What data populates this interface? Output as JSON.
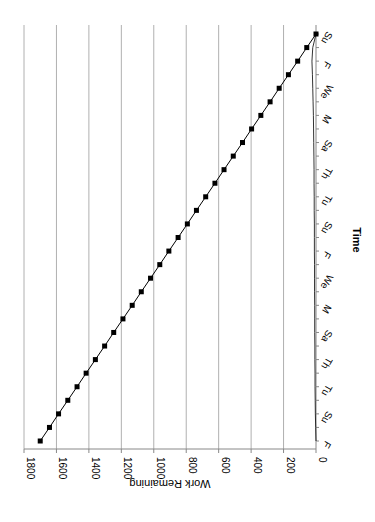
{
  "chart_data": {
    "type": "line",
    "orientation": "rotated-90",
    "title": "",
    "xlabel": "Time",
    "ylabel": "Work Remaining",
    "ylim": [
      0,
      1800
    ],
    "yticks": [
      0,
      200,
      400,
      600,
      800,
      1000,
      1200,
      1400,
      1600,
      1800
    ],
    "grid": true,
    "legend": "none",
    "x_tick_labels": [
      "F",
      "Su",
      "Tu",
      "Th",
      "Sa",
      "M",
      "We",
      "F",
      "Su",
      "Tu",
      "Th",
      "Sa",
      "M",
      "We",
      "F",
      "Su"
    ],
    "x": [
      1,
      2,
      3,
      4,
      5,
      6,
      7,
      8,
      9,
      10,
      11,
      12,
      13,
      14,
      15,
      16,
      17,
      18,
      19,
      20,
      21,
      22,
      23,
      24,
      25,
      26,
      27,
      28,
      29,
      30,
      31
    ],
    "series": [
      {
        "name": "Ideal Work Remaining",
        "marker": "square",
        "values": [
          1700,
          1643,
          1587,
          1530,
          1473,
          1417,
          1360,
          1303,
          1247,
          1190,
          1133,
          1077,
          1020,
          963,
          907,
          850,
          793,
          737,
          680,
          623,
          567,
          510,
          453,
          397,
          340,
          283,
          227,
          170,
          113,
          57,
          0
        ]
      },
      {
        "name": "Actual Work Remaining",
        "marker": "none",
        "values": [
          0,
          2,
          4,
          5,
          6,
          6,
          7,
          7,
          8,
          8,
          8,
          9,
          9,
          9,
          10,
          10,
          10,
          11,
          11,
          12,
          12,
          13,
          14,
          15,
          16,
          18,
          20,
          22,
          25,
          20,
          0
        ]
      }
    ]
  }
}
